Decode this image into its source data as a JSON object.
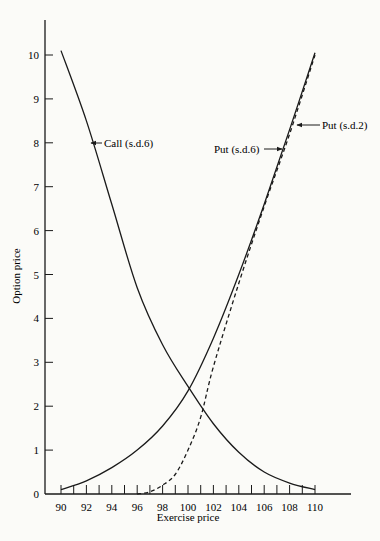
{
  "chart_data": {
    "type": "line",
    "title": "",
    "xlabel": "Exercise price",
    "ylabel": "Option price",
    "xlim": [
      90,
      112
    ],
    "ylim": [
      0,
      10.8
    ],
    "grid": false,
    "legend": "none (inline arrow annotations)",
    "x_ticks": [
      90,
      92,
      94,
      96,
      98,
      100,
      102,
      104,
      106,
      108,
      110
    ],
    "x_minor_ticks_step": 1,
    "y_ticks": [
      0,
      1,
      2,
      3,
      4,
      5,
      6,
      7,
      8,
      9,
      10
    ],
    "series": [
      {
        "name": "Call (s.d.6)",
        "style": "solid",
        "x": [
          90,
          92,
          94,
          96,
          98,
          100,
          102,
          104,
          106,
          108,
          110
        ],
        "values": [
          10.1,
          8.5,
          6.6,
          4.7,
          3.4,
          2.45,
          1.6,
          0.95,
          0.5,
          0.25,
          0.1
        ]
      },
      {
        "name": "Put (s.d.6)",
        "style": "solid",
        "x": [
          90,
          92,
          94,
          96,
          98,
          100,
          102,
          104,
          106,
          108,
          110
        ],
        "values": [
          0.1,
          0.3,
          0.6,
          1.0,
          1.55,
          2.35,
          3.55,
          5.0,
          6.6,
          8.3,
          10.05
        ]
      },
      {
        "name": "Put (s.d.2)",
        "style": "dashed",
        "x": [
          96,
          97,
          98,
          99,
          100,
          101,
          102,
          104,
          106,
          108,
          110
        ],
        "values": [
          0.0,
          0.05,
          0.2,
          0.45,
          1.0,
          1.75,
          2.9,
          4.8,
          6.55,
          8.2,
          10.0
        ]
      }
    ],
    "annotations": [
      {
        "text": "Call (s.d.6)",
        "arrow_to": [
          92.3,
          8.0
        ]
      },
      {
        "text": "Put (s.d.6)",
        "arrow_to": [
          107.6,
          7.9
        ]
      },
      {
        "text": "Put (s.d.2)",
        "arrow_to": [
          108.1,
          8.4
        ]
      }
    ]
  },
  "labels": {
    "xlabel": "Exercise price",
    "ylabel": "Option price",
    "call": "Call (s.d.6)",
    "put6": "Put (s.d.6)",
    "put2": "Put (s.d.2)"
  }
}
